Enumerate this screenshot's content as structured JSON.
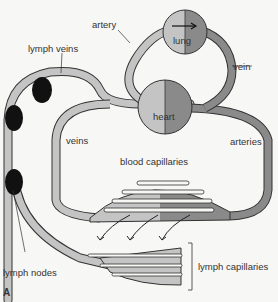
{
  "diagram": {
    "type": "circulatory-lymphatic-system",
    "figure_label": "A",
    "labels": {
      "artery": "artery",
      "lung": "lung",
      "vein": "vein",
      "lymph_veins": "lymph veins",
      "heart": "heart",
      "veins": "veins",
      "arteries": "arteries",
      "blood_capillaries": "blood capillaries",
      "lymph_nodes": "lymph nodes",
      "lymph_capillaries": "lymph capillaries"
    },
    "colors": {
      "vessel_light": "#c4c4c4",
      "vessel_dark": "#8a8a8a",
      "outline": "#333333",
      "lymph_node": "#111111",
      "background": "#f7f7f5"
    }
  }
}
